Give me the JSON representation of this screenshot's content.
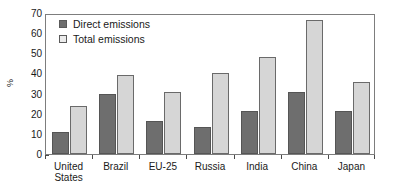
{
  "chart_data": {
    "type": "bar",
    "title": "",
    "xlabel": "",
    "ylabel": "%",
    "ylim": [
      0,
      70
    ],
    "yticks": [
      0,
      10,
      20,
      30,
      40,
      50,
      60,
      70
    ],
    "grid": false,
    "legend_position": "top-left",
    "categories": [
      "United\nStates",
      "Brazil",
      "EU-25",
      "Russia",
      "India",
      "China",
      "Japan"
    ],
    "series": [
      {
        "name": "Direct emissions",
        "color": "#6e6e6e",
        "values": [
          11,
          30,
          16.5,
          13.5,
          21.5,
          31,
          21.5
        ]
      },
      {
        "name": "Total emissions",
        "color": "#d6d6d6",
        "values": [
          24,
          39,
          31,
          40,
          48,
          66.5,
          36
        ]
      }
    ]
  },
  "legend": {
    "items": [
      {
        "label": "Direct emissions",
        "swatch": "dark-square-icon"
      },
      {
        "label": "Total emissions",
        "swatch": "light-square-icon"
      }
    ]
  }
}
